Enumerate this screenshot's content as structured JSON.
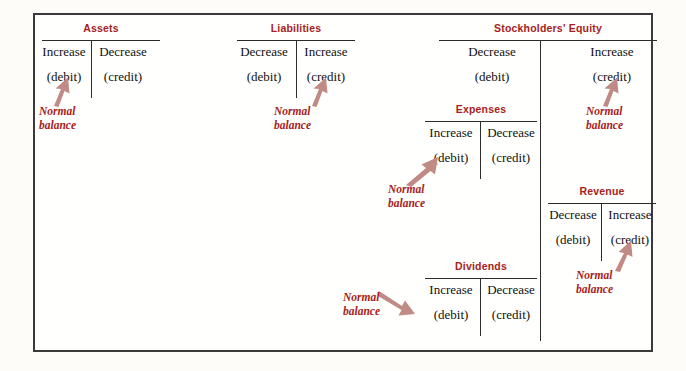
{
  "diagram": {
    "normal_balance_label": {
      "line1": "Normal",
      "line2": "balance"
    },
    "accent_color": "#a81d21",
    "arrow_color": "#c08a85",
    "rule_color": "#2b2b2b",
    "border_color": "#3a3a3a",
    "background_color": "#fffffd"
  },
  "accounts": [
    {
      "id": "assets",
      "name": "Assets",
      "left": {
        "effect": "Increase",
        "entry": "(debit)"
      },
      "right": {
        "effect": "Decrease",
        "entry": "(credit)"
      },
      "normal_balance_side": "debit",
      "arrow_direction": "up-right"
    },
    {
      "id": "liabilities",
      "name": "Liabilities",
      "left": {
        "effect": "Decrease",
        "entry": "(debit)"
      },
      "right": {
        "effect": "Increase",
        "entry": "(credit)"
      },
      "normal_balance_side": "credit",
      "arrow_direction": "up-right"
    },
    {
      "id": "stockholders-equity",
      "name": "Stockholders' Equity",
      "left": {
        "effect": "Decrease",
        "entry": "(debit)"
      },
      "right": {
        "effect": "Increase",
        "entry": "(credit)"
      },
      "normal_balance_side": "credit",
      "arrow_direction": "up-right"
    },
    {
      "id": "expenses",
      "name": "Expenses",
      "left": {
        "effect": "Increase",
        "entry": "(debit)"
      },
      "right": {
        "effect": "Decrease",
        "entry": "(credit)"
      },
      "normal_balance_side": "debit",
      "arrow_direction": "up-right"
    },
    {
      "id": "revenue",
      "name": "Revenue",
      "left": {
        "effect": "Decrease",
        "entry": "(debit)"
      },
      "right": {
        "effect": "Increase",
        "entry": "(credit)"
      },
      "normal_balance_side": "credit",
      "arrow_direction": "up-right"
    },
    {
      "id": "dividends",
      "name": "Dividends",
      "left": {
        "effect": "Increase",
        "entry": "(debit)"
      },
      "right": {
        "effect": "Decrease",
        "entry": "(credit)"
      },
      "normal_balance_side": "debit",
      "arrow_direction": "down-right"
    }
  ]
}
